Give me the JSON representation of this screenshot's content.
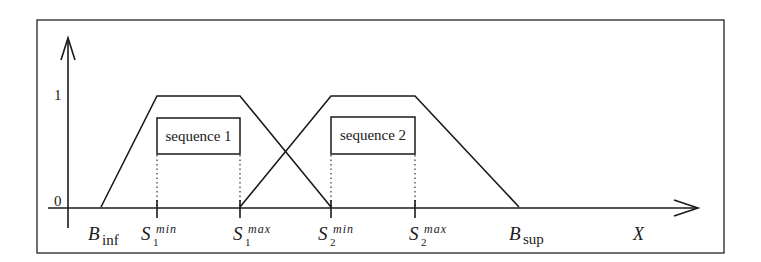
{
  "figure": {
    "y_axis": {
      "tick_top_label": "1",
      "tick_bottom_label": "0"
    },
    "x_axis": {
      "label": "X"
    },
    "bounds": {
      "inf": {
        "base": "B",
        "sub": "inf"
      },
      "sup": {
        "base": "B",
        "sub": "sup"
      }
    },
    "markers": [
      {
        "base": "S",
        "sub": "1",
        "sup": "min"
      },
      {
        "base": "S",
        "sub": "1",
        "sup": "max"
      },
      {
        "base": "S",
        "sub": "2",
        "sup": "min"
      },
      {
        "base": "S",
        "sub": "2",
        "sup": "max"
      }
    ],
    "sequences": [
      {
        "label": "sequence 1"
      },
      {
        "label": "sequence 2"
      }
    ]
  }
}
